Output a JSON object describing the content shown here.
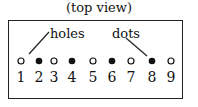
{
  "caption": "(top view)",
  "labels": {
    "holes": "holes",
    "dots": "dots"
  },
  "positions": [
    {
      "number": "1",
      "type": "hole"
    },
    {
      "number": "2",
      "type": "dot"
    },
    {
      "number": "3",
      "type": "hole"
    },
    {
      "number": "4",
      "type": "dot"
    },
    {
      "number": "5",
      "type": "hole"
    },
    {
      "number": "6",
      "type": "dot"
    },
    {
      "number": "7",
      "type": "hole"
    },
    {
      "number": "8",
      "type": "dot"
    },
    {
      "number": "9",
      "type": "hole"
    }
  ]
}
